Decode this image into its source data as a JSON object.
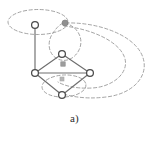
{
  "figure": {
    "caption": "a)",
    "type": "hypergraph-diagram",
    "background_color": "#ffffff",
    "colors": {
      "edge_solid": "#6e6e6e",
      "edge_dashed": "#9a9a9a",
      "node_outline": "#4a4a4a",
      "node_fill": "#ffffff",
      "marker_gray": "#9a9a9a",
      "caption_text": "#2b2b2b"
    },
    "nodes": [
      {
        "id": "n-top-left",
        "label": "",
        "shape": "circle-open",
        "cx": 35,
        "cy": 25,
        "r": 3.4
      },
      {
        "id": "n-diamond-top",
        "label": "",
        "shape": "circle-open",
        "cx": 62,
        "cy": 54,
        "r": 3.4
      },
      {
        "id": "n-diamond-left",
        "label": "",
        "shape": "circle-open",
        "cx": 35,
        "cy": 73,
        "r": 3.4
      },
      {
        "id": "n-diamond-right",
        "label": "",
        "shape": "circle-open",
        "cx": 90,
        "cy": 73,
        "r": 3.4
      },
      {
        "id": "n-diamond-bottom",
        "label": "",
        "shape": "circle-open",
        "cx": 62,
        "cy": 95,
        "r": 3.4
      }
    ],
    "markers": [
      {
        "id": "m-top-gray-dot",
        "shape": "circle-filled",
        "cx": 65,
        "cy": 23,
        "r": 3.0
      },
      {
        "id": "m-inner-square-1",
        "shape": "square-filled",
        "cx": 63,
        "cy": 64,
        "size": 4.4
      },
      {
        "id": "m-inner-square-2",
        "shape": "square-filled",
        "cx": 62,
        "cy": 79,
        "size": 4.0
      }
    ],
    "solid_edges": [
      {
        "id": "e-vertical",
        "from": "n-top-left",
        "to": "n-diamond-left"
      },
      {
        "id": "e-left-top",
        "from": "n-diamond-left",
        "to": "n-diamond-top"
      },
      {
        "id": "e-top-right",
        "from": "n-diamond-top",
        "to": "n-diamond-right"
      },
      {
        "id": "e-left-right",
        "from": "n-diamond-left",
        "to": "n-diamond-right"
      },
      {
        "id": "e-left-bottom",
        "from": "n-diamond-left",
        "to": "n-diamond-bottom"
      },
      {
        "id": "e-bottom-right",
        "from": "n-diamond-bottom",
        "to": "n-diamond-right"
      }
    ],
    "hyperedges": [
      {
        "id": "h-top-left-ellipse",
        "description": "dashed ellipse around top-left node and gray dot"
      },
      {
        "id": "h-upper-loop",
        "description": "dashed loop from gray dot down around diamond top node"
      },
      {
        "id": "h-right-outer-curve",
        "description": "large dashed curve sweeping right"
      },
      {
        "id": "h-right-inner-curve",
        "description": "inner dashed curve sweeping right"
      },
      {
        "id": "h-bottom-ellipse",
        "description": "dashed ellipse around bottom node area"
      }
    ]
  }
}
